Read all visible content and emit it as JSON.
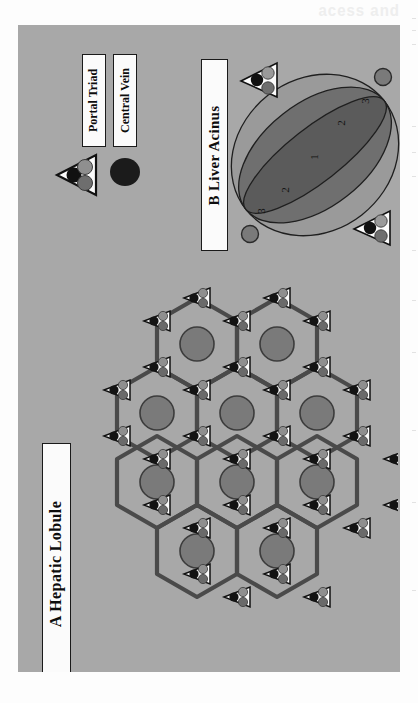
{
  "figure": {
    "background_color": "#a8a8a8",
    "page_color": "#fdfdfd",
    "scan_header_text": "acess and",
    "panels": [
      {
        "id": "A",
        "label": "A  Hepatic Lobule"
      },
      {
        "id": "B",
        "label": "B Liver Acinus"
      }
    ]
  },
  "legend": {
    "portal_triad_label": "Portal Triad",
    "central_vein_label": "Central Vein",
    "portal_triad_icon": "triangle-with-three-circles-icon",
    "central_vein_icon": "filled-circle-icon",
    "colors": {
      "triad_outline": "#111111",
      "triad_fill": "#fbfbfb",
      "triad_circle_dark": "#111111",
      "triad_circle_gray_light": "#8f8f8f",
      "triad_circle_gray_mid": "#6e6e6e",
      "central_vein_dark": "#1b1b1b",
      "central_vein_gray": "#7a7a7a"
    }
  },
  "panel_a": {
    "title": "A  Hepatic Lobule",
    "description": "Hexagonal hepatic lobules with a central vein at the centre of each hexagon and portal triads at the hexagon vertices.",
    "hexagon_count": 9,
    "rows": [
      2,
      3,
      3,
      2
    ],
    "hexagon_outline_color": "#4a4a4a",
    "central_vein_color": "#7a7a7a",
    "central_vein_outline": "#3c3c3c"
  },
  "panel_b": {
    "title": "B Liver Acinus",
    "description": "Liver acinus with three metabolic zones between two portal triads and two central veins.",
    "zones": [
      {
        "label": "1",
        "name": "zone-1-periportal",
        "color": "#5b5b5b"
      },
      {
        "label": "2",
        "name": "zone-2-midzonal",
        "color": "#6f6f6f"
      },
      {
        "label": "2",
        "name": "zone-2-midzonal-b",
        "color": "#6f6f6f"
      },
      {
        "label": "3",
        "name": "zone-3-pericentral",
        "color": "#9a9a9a"
      },
      {
        "label": "3",
        "name": "zone-3-pericentral-b",
        "color": "#9a9a9a"
      }
    ],
    "portal_triad_count": 2,
    "central_vein_count": 2,
    "outline_color": "#1a1a1a"
  }
}
